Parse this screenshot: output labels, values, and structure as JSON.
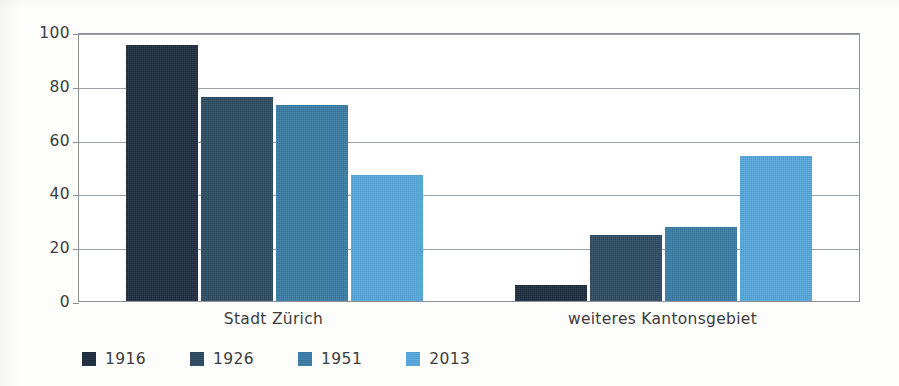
{
  "chart_data": {
    "type": "bar",
    "title": "",
    "subtitle": "",
    "xlabel": "",
    "ylabel": "",
    "categories": [
      "Stadt Zürich",
      "weiteres Kantonsgebiet"
    ],
    "series": [
      {
        "name": "1916",
        "color": "#1c2c3e",
        "values": [
          95,
          6
        ]
      },
      {
        "name": "1926",
        "color": "#2c4a61",
        "values": [
          76,
          24.5
        ]
      },
      {
        "name": "1951",
        "color": "#3a7ca5",
        "values": [
          73,
          27.5
        ]
      },
      {
        "name": "2013",
        "color": "#55a7dd",
        "values": [
          47,
          54
        ]
      }
    ],
    "ylim": [
      0,
      100
    ],
    "yticks": [
      0,
      20,
      40,
      60,
      80,
      100
    ],
    "ytick_labels": [
      "0",
      "20",
      "40",
      "60",
      "80",
      "100"
    ],
    "grid": true,
    "grid_axis": "y",
    "legend": {
      "position": "bottom-left",
      "orientation": "horizontal"
    }
  },
  "axis": {
    "ytick_labels": [
      "100",
      "80",
      "60",
      "40",
      "20",
      "0"
    ]
  },
  "legend_items": [
    {
      "label": "1916",
      "color": "#1c2c3e"
    },
    {
      "label": "1926",
      "color": "#2c4a61"
    },
    {
      "label": "1951",
      "color": "#3a7ca5"
    },
    {
      "label": "2013",
      "color": "#55a7dd"
    }
  ],
  "categories": [
    {
      "label": "Stadt Zürich"
    },
    {
      "label": "weiteres Kantonsgebiet"
    }
  ],
  "colors": {
    "series_1916": "#1c2c3e",
    "series_1926": "#2c4a61",
    "series_1951": "#3a7ca5",
    "series_2013": "#55a7dd",
    "gridline": "#9aa0a5",
    "axis": "#8d9196",
    "text": "#3c3c3c",
    "background": "#fdfdfc"
  }
}
